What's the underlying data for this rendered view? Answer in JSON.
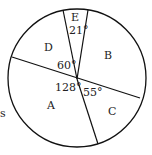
{
  "diagram": {
    "type": "pie-sector-diagram",
    "sectors": [
      {
        "label": "A",
        "angle": "128°"
      },
      {
        "label": "B",
        "angle": ""
      },
      {
        "label": "C",
        "angle": "55°"
      },
      {
        "label": "D",
        "angle": "60°"
      },
      {
        "label": "E",
        "angle": "21°"
      }
    ],
    "edge_text": "s"
  }
}
